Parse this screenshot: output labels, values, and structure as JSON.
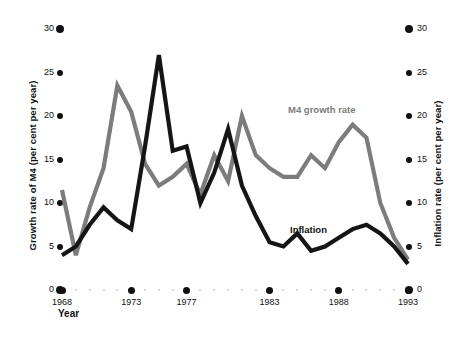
{
  "chart_data": {
    "type": "line",
    "title": "",
    "xlabel": "Year",
    "ylabel_left": "Growth rate of M4 (per cent per year)",
    "ylabel_right": "Inflation rate (per cent per year)",
    "xlim": [
      1968,
      1993
    ],
    "ylim": [
      0,
      30
    ],
    "ytick_values": [
      0,
      5,
      10,
      15,
      20,
      25,
      30
    ],
    "ytick_labels_left": [
      "0",
      "5",
      "10",
      "15",
      "20",
      "25",
      "30"
    ],
    "ytick_labels_right": [
      "0",
      "5",
      "10",
      "15",
      "20",
      "25",
      "30"
    ],
    "xtick_values": [
      1968,
      1973,
      1977,
      1983,
      1988,
      1993
    ],
    "xtick_labels": [
      "1968",
      "1973",
      "1977",
      "1983",
      "1988",
      "1993"
    ],
    "grid": false,
    "legend_position": "inline-annotations",
    "x": [
      1968,
      1969,
      1970,
      1971,
      1972,
      1973,
      1974,
      1975,
      1976,
      1977,
      1978,
      1979,
      1980,
      1981,
      1982,
      1983,
      1984,
      1985,
      1986,
      1987,
      1988,
      1989,
      1990,
      1991,
      1992,
      1993
    ],
    "series": [
      {
        "name": "M4 growth rate",
        "color": "#7c7c7c",
        "values": [
          11.5,
          4.0,
          9.5,
          14.0,
          23.5,
          20.5,
          14.5,
          12.0,
          13.0,
          14.5,
          11.0,
          15.5,
          12.5,
          20.0,
          15.5,
          14.0,
          13.0,
          13.0,
          15.5,
          14.0,
          17.0,
          19.0,
          17.5,
          10.0,
          6.0,
          3.5
        ]
      },
      {
        "name": "Inflation",
        "color": "#151515",
        "values": [
          4.0,
          5.0,
          7.5,
          9.5,
          8.0,
          7.0,
          16.5,
          27.0,
          16.0,
          16.5,
          10.0,
          13.5,
          18.5,
          12.0,
          8.5,
          5.5,
          5.0,
          6.5,
          4.5,
          5.0,
          6.0,
          7.0,
          7.5,
          6.5,
          5.0,
          3.0
        ]
      }
    ],
    "annotations": [
      {
        "text": "M4 growth rate",
        "color": "#7c7c7c"
      },
      {
        "text": "Inflation",
        "color": "#151515"
      }
    ]
  }
}
